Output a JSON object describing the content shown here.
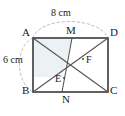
{
  "figure": {
    "shape": "rectangle",
    "stroke_color": "#3a3a3a",
    "dashed_color": "#b8b8b8",
    "shaded_color": "#e8edf1",
    "background_color": "#ffffff",
    "dimensions": {
      "width_label": "8 cm",
      "height_label": "6 cm",
      "width_value": 8,
      "height_value": 6,
      "units": "cm"
    },
    "vertices": [
      {
        "name": "A",
        "label": "A",
        "position": "top-left"
      },
      {
        "name": "M",
        "label": "M",
        "position": "top-middle"
      },
      {
        "name": "D",
        "label": "D",
        "position": "top-right"
      },
      {
        "name": "F",
        "label": "F",
        "position": "interior-right"
      },
      {
        "name": "E",
        "label": "E",
        "position": "interior-left"
      },
      {
        "name": "B",
        "label": "B",
        "position": "bottom-left"
      },
      {
        "name": "N",
        "label": "N",
        "position": "bottom-middle"
      },
      {
        "name": "C",
        "label": "C",
        "position": "bottom-right"
      }
    ],
    "segments": [
      "AD",
      "DC",
      "CB",
      "BA",
      "AC",
      "BD",
      "MN"
    ]
  }
}
